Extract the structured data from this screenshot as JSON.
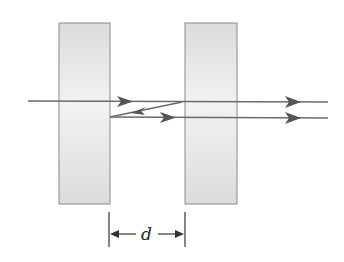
{
  "diagram": {
    "title": "",
    "colors": {
      "plate_fill": "#e4e4e4",
      "plate_stroke": "#8a8a8a",
      "ray": "#6a6a6a",
      "arrow": "#555555",
      "dimension": "#333333"
    },
    "plates": [
      {
        "name": "left-plate",
        "x": 59,
        "y": 23,
        "width": 51,
        "height": 181
      },
      {
        "name": "right-plate",
        "x": 185,
        "y": 23,
        "width": 52,
        "height": 181
      }
    ],
    "rays": [
      {
        "name": "incident-ray",
        "points": [
          [
            28,
            101
          ],
          [
            182,
            102
          ],
          [
            328,
            102
          ]
        ]
      },
      {
        "name": "reflected-ray",
        "points": [
          [
            182,
            102
          ],
          [
            110,
            117
          ]
        ]
      },
      {
        "name": "second-transmitted-ray",
        "points": [
          [
            110,
            117
          ],
          [
            328,
            118
          ]
        ]
      }
    ],
    "dimension": {
      "label": "d",
      "left_x": 109,
      "right_x": 185,
      "y": 234
    }
  }
}
